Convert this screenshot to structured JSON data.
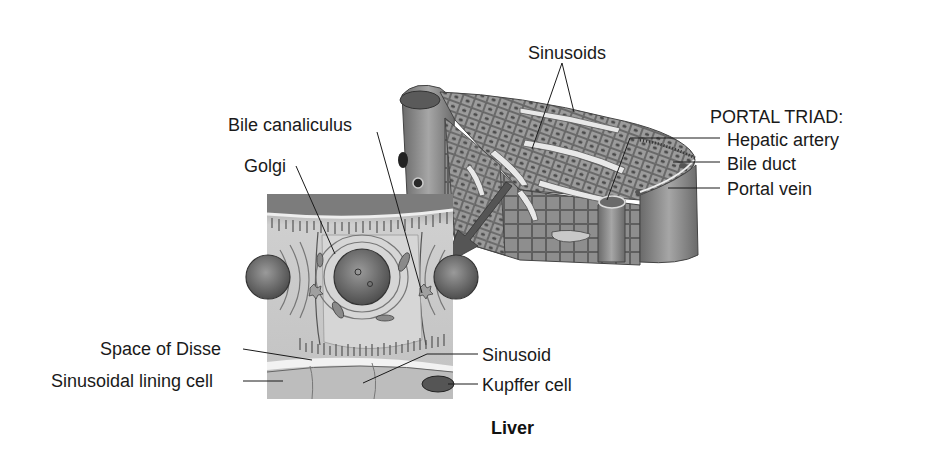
{
  "figure": {
    "title": "Liver"
  },
  "labels": {
    "sinusoids": "Sinusoids",
    "portal_triad_heading": "PORTAL TRIAD:",
    "hepatic_artery": "Hepatic artery",
    "bile_duct": "Bile duct",
    "portal_vein": "Portal vein",
    "bile_canaliculus": "Bile canaliculus",
    "golgi": "Golgi",
    "space_of_disse": "Space of Disse",
    "sinusoidal_lining_cell": "Sinusoidal lining cell",
    "sinusoid": "Sinusoid",
    "kupffer_cell": "Kupffer cell"
  },
  "colors": {
    "ink": "#1a1a1a",
    "tissue_dark": "#6e6e6e",
    "tissue_mid": "#a8a8a8",
    "tissue_light": "#d9d9d9",
    "background": "#ffffff"
  }
}
